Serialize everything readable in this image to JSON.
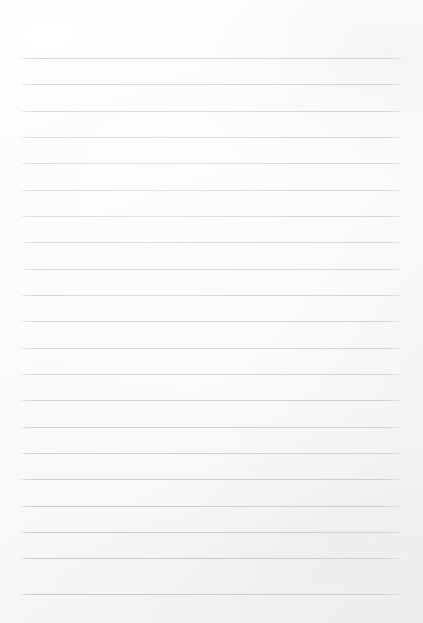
{
  "page": {
    "kind": "ruled-notebook-paper",
    "width_px": 423,
    "height_px": 623,
    "paper_color": "#fbfbfc",
    "has_text_content": false,
    "text_content": "",
    "watermark": "",
    "header": "",
    "footer": ""
  },
  "ruling": {
    "line_color": "#c4c4ca",
    "line_thickness_px": 1,
    "line_count": 21,
    "line_spacing_px": 26.3,
    "first_line_y_px": 58,
    "last_line_y_px": 594,
    "line_start_x_px": 19,
    "line_end_x_px": 403,
    "top_margin_px": 58,
    "bottom_margin_px": 29,
    "left_margin_px": 19,
    "right_margin_px": 20,
    "has_vertical_margin_rule": false,
    "lines": [
      {
        "index": 1,
        "y": 58,
        "content": ""
      },
      {
        "index": 2,
        "y": 84,
        "content": ""
      },
      {
        "index": 3,
        "y": 111,
        "content": ""
      },
      {
        "index": 4,
        "y": 137,
        "content": ""
      },
      {
        "index": 5,
        "y": 163,
        "content": ""
      },
      {
        "index": 6,
        "y": 190,
        "content": ""
      },
      {
        "index": 7,
        "y": 216,
        "content": ""
      },
      {
        "index": 8,
        "y": 242,
        "content": ""
      },
      {
        "index": 9,
        "y": 269,
        "content": ""
      },
      {
        "index": 10,
        "y": 295,
        "content": ""
      },
      {
        "index": 11,
        "y": 321,
        "content": ""
      },
      {
        "index": 12,
        "y": 348,
        "content": ""
      },
      {
        "index": 13,
        "y": 374,
        "content": ""
      },
      {
        "index": 14,
        "y": 400,
        "content": ""
      },
      {
        "index": 15,
        "y": 427,
        "content": ""
      },
      {
        "index": 16,
        "y": 453,
        "content": ""
      },
      {
        "index": 17,
        "y": 479,
        "content": ""
      },
      {
        "index": 18,
        "y": 506,
        "content": ""
      },
      {
        "index": 19,
        "y": 532,
        "content": ""
      },
      {
        "index": 20,
        "y": 558,
        "content": ""
      },
      {
        "index": 21,
        "y": 594,
        "content": ""
      }
    ]
  }
}
